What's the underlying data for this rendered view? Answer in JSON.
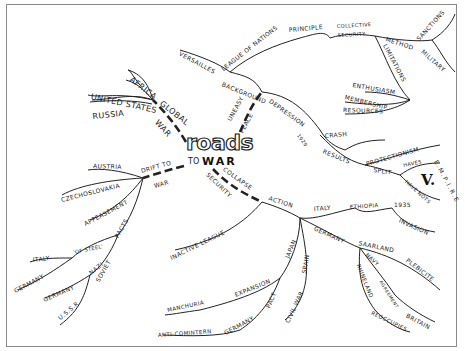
{
  "title": {
    "roads": "roads",
    "to": "TO",
    "war": "WAR"
  },
  "colors": {
    "ink": "#222222",
    "frame": "#8a8a8a",
    "background": "#ffffff"
  },
  "branches": {
    "global_war": {
      "label_a": "GLOBAL",
      "label_b": "WAR",
      "children": [
        "AFRICA",
        "UNITED STATES",
        "RUSSIA"
      ]
    },
    "uneasy_peace": {
      "label_a": "UNEASY",
      "label_b": "PEACE",
      "background": {
        "label": "BACKGROUND",
        "versailles": "VERSAILLES",
        "league": "LEAGUE OF NATIONS",
        "principle": "PRINCIPLE",
        "collective": "COLLECTIVE",
        "security": "SECURITY",
        "method": "METHOD",
        "sanctions": "SANCTIONS",
        "military": "MILITARY",
        "limitations": "LIMITATIONS",
        "limitation_items": [
          "ENTHUSIASM",
          "MEMBERSHIP",
          "RESOURCES"
        ]
      },
      "depression": {
        "label": "DEPRESSION",
        "year": "1929",
        "crash": "CRASH",
        "results": "RESULTS",
        "protectionism": "PROTECTIONISM",
        "split": "SPLIT",
        "haves": "HAVES",
        "have_nots": "HAVE NOTS",
        "empire": "E.M.P.I.R.E",
        "versus": "V."
      }
    },
    "drift_to_war": {
      "label_a": "DRIFT TO",
      "label_b": "WAR",
      "children": [
        "AUSTRIA",
        "CZECHOSLOVAKIA",
        "APPEASEMENT"
      ],
      "pacts": {
        "label": "PACTS",
        "of_steel": "'OF STEEL'",
        "of_steel_children": [
          "ITALY",
          "GERMANY"
        ],
        "nazi_soviet": [
          "NAZI",
          "SOVIET"
        ],
        "nazi_soviet_children": [
          "GERMANY",
          "U.S.S.R"
        ]
      }
    },
    "collapse_security": {
      "label_a": "COLLAPSE",
      "label_b": "SECURITY",
      "inactive_league": "INACTIVE LEAGUE",
      "action": {
        "label": "ACTION",
        "italy": "ITALY",
        "ethiopia": "ETHIOPIA",
        "year": "1935",
        "invasion": "INVASION",
        "japan": "JAPAN",
        "expansion": "EXPANSION",
        "manchuria": "MANCHURIA",
        "pact": "PACT",
        "germany_pact": "GERMANY",
        "anti_comintern": "ANTI-COMINTERN",
        "spain": "SPAIN",
        "civil_war": "CIVIL WAR",
        "germany": "GERMANY",
        "saarland": "SAARLAND",
        "plebicite": "PLEBICITE",
        "navy": "NAVY",
        "agreement": "AGREEMENT",
        "britain": "BRITAIN",
        "rhineland": "RHINELAND",
        "reoccupies": "REOCCUPIES"
      }
    }
  }
}
